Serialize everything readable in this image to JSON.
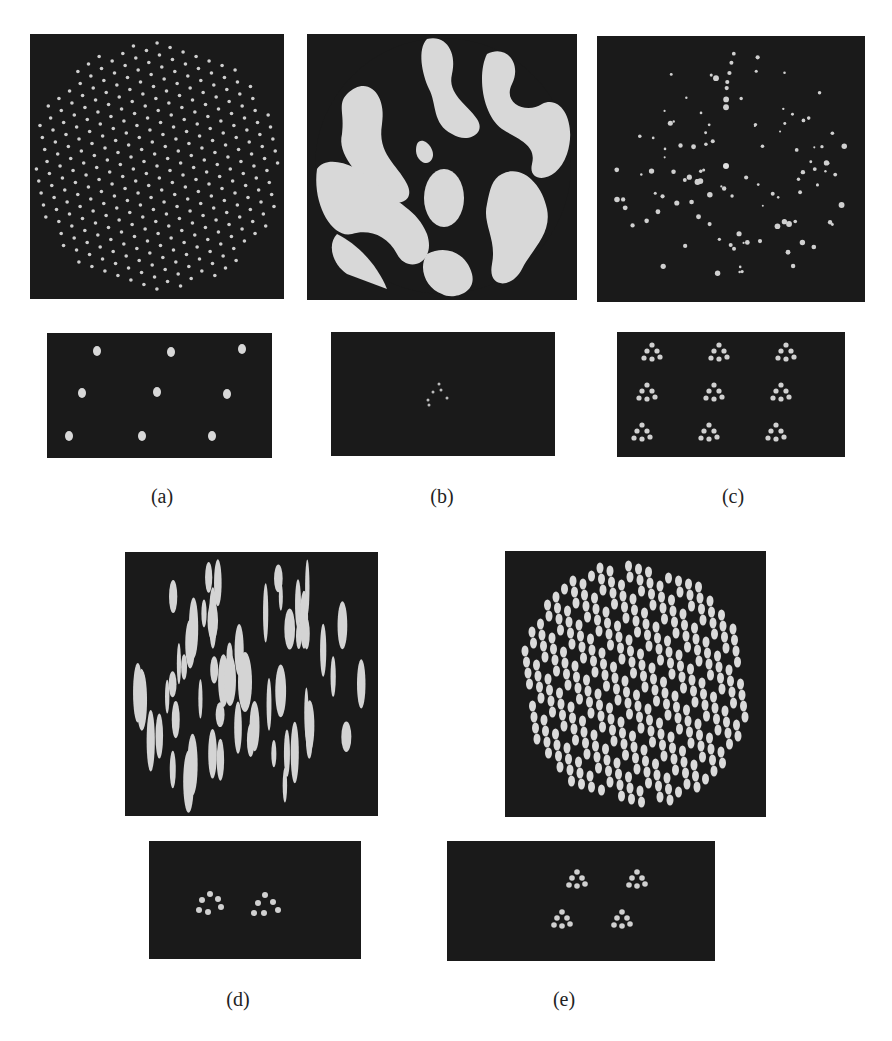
{
  "figure": {
    "panels": [
      {
        "id": "a",
        "label": "(a)",
        "description": "Hexagonal lattice of point spots and 3x3 array reconstruction"
      },
      {
        "id": "b",
        "label": "(b)",
        "description": "Circular aperture with worm-like phase mask pattern and faint central cluster reconstruction"
      },
      {
        "id": "c",
        "label": "(c)",
        "description": "Sparse spot pattern and 3x3 array of triangular spot clusters"
      },
      {
        "id": "d",
        "label": "(d)",
        "description": "Vertical elongated ellipse pattern and two triangular spot clusters"
      },
      {
        "id": "e",
        "label": "(e)",
        "description": "Elliptical spot lattice pattern and 2x2 array of triangular spot clusters"
      }
    ],
    "colors": {
      "background": "#1a1a1a",
      "spot": "#d8d8d8",
      "page": "#ffffff"
    }
  }
}
